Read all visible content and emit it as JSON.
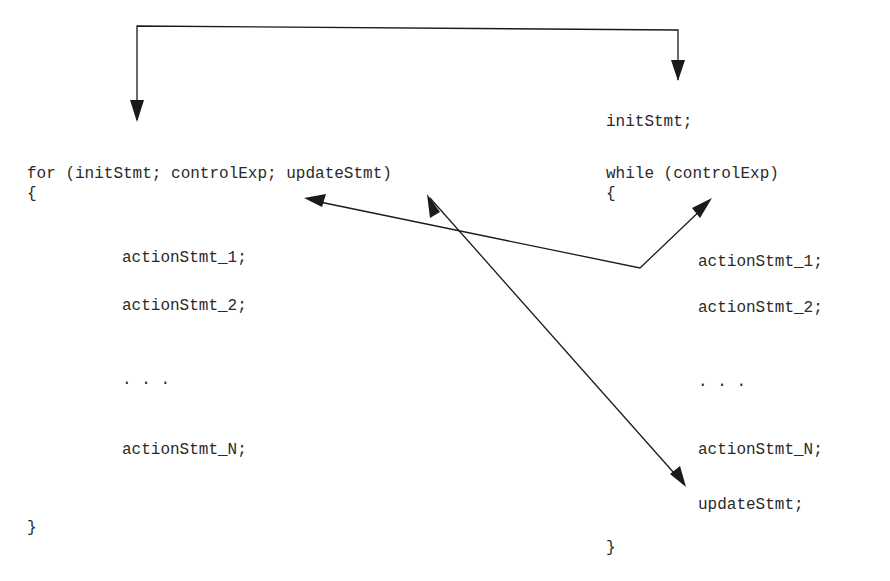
{
  "for_loop": {
    "header": "for (initStmt; controlExp; updateStmt)",
    "open_brace": "{",
    "actions": [
      "actionStmt_1;",
      "actionStmt_2;",
      ". . .",
      "actionStmt_N;"
    ],
    "close_brace": "}"
  },
  "while_loop": {
    "init": "initStmt;",
    "header": "while (controlExp)",
    "open_brace": "{",
    "actions": [
      "actionStmt_1;",
      "actionStmt_2;",
      ". . .",
      "actionStmt_N;"
    ],
    "update": "updateStmt;",
    "close_brace": "}"
  },
  "colors": {
    "ink": "#1a1a1a",
    "text": "#2a2a2a",
    "background": "#ffffff"
  }
}
